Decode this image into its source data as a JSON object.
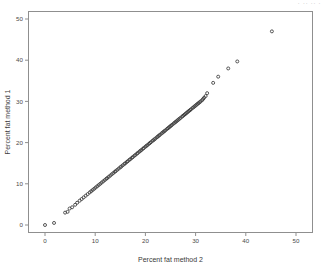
{
  "window": {
    "title_sliver": "·  ··    ··    ·"
  },
  "chart_data": {
    "type": "scatter",
    "title": "",
    "xlabel": "Percent fat method 2",
    "ylabel": "Percent fat method 1",
    "xlim": [
      -3,
      53
    ],
    "ylim": [
      -3,
      53
    ],
    "xticks": [
      0,
      10,
      20,
      30,
      40,
      50
    ],
    "yticks": [
      0,
      10,
      20,
      30,
      40,
      50
    ],
    "xticklabels": [
      "0",
      "10",
      "20",
      "30",
      "40",
      "50"
    ],
    "yticklabels": [
      "0",
      "10",
      "20",
      "30",
      "40",
      "50"
    ],
    "grid": false,
    "legend": null,
    "marker": "open-circle",
    "marker_color": "#3a3a3a",
    "marker_size": 3.0,
    "frame": "box",
    "series": [
      {
        "name": "Percent fat method 1 vs method 2",
        "x": [
          0.0,
          1.8,
          4.0,
          4.5,
          4.9,
          5.4,
          6.0,
          6.4,
          6.9,
          7.3,
          7.7,
          8.1,
          8.5,
          8.9,
          9.2,
          9.5,
          9.8,
          10.1,
          10.4,
          10.7,
          11.0,
          11.3,
          11.6,
          11.9,
          12.2,
          12.4,
          12.7,
          13.0,
          13.3,
          13.6,
          13.9,
          14.1,
          14.4,
          14.7,
          15.0,
          15.2,
          15.5,
          15.8,
          16.0,
          16.3,
          16.5,
          16.8,
          17.0,
          17.3,
          17.5,
          17.8,
          18.0,
          18.3,
          18.5,
          18.8,
          19.0,
          19.2,
          19.5,
          19.7,
          20.0,
          20.2,
          20.4,
          20.7,
          20.9,
          21.1,
          21.4,
          21.6,
          21.8,
          22.0,
          22.3,
          22.5,
          22.7,
          22.9,
          23.2,
          23.4,
          23.6,
          23.8,
          24.0,
          24.3,
          24.5,
          24.7,
          24.9,
          25.1,
          25.3,
          25.6,
          25.8,
          26.0,
          26.2,
          26.4,
          26.6,
          26.8,
          27.0,
          27.3,
          27.5,
          27.7,
          27.9,
          28.1,
          28.3,
          28.5,
          28.7,
          28.9,
          29.1,
          29.4,
          29.6,
          29.8,
          30.0,
          30.2,
          30.4,
          30.6,
          30.8,
          31.0,
          31.3,
          31.5,
          31.7,
          32.0,
          32.3,
          33.5,
          34.5,
          36.5,
          38.3,
          45.2
        ],
        "y": [
          0.0,
          0.5,
          3.0,
          3.2,
          4.0,
          4.3,
          4.9,
          5.4,
          5.9,
          6.3,
          6.7,
          7.1,
          7.5,
          7.9,
          8.2,
          8.5,
          8.8,
          9.1,
          9.4,
          9.7,
          10.0,
          10.3,
          10.6,
          10.9,
          11.2,
          11.4,
          11.7,
          12.0,
          12.3,
          12.6,
          12.9,
          13.1,
          13.4,
          13.7,
          14.0,
          14.2,
          14.5,
          14.8,
          15.0,
          15.3,
          15.5,
          15.8,
          16.0,
          16.3,
          16.5,
          16.8,
          17.0,
          17.3,
          17.5,
          17.8,
          18.0,
          18.2,
          18.5,
          18.7,
          19.0,
          19.2,
          19.4,
          19.7,
          19.9,
          20.1,
          20.4,
          20.6,
          20.8,
          21.0,
          21.3,
          21.5,
          21.7,
          21.9,
          22.2,
          22.4,
          22.6,
          22.8,
          23.0,
          23.3,
          23.5,
          23.7,
          23.9,
          24.1,
          24.3,
          24.6,
          24.8,
          25.0,
          25.2,
          25.4,
          25.6,
          25.8,
          26.0,
          26.3,
          26.5,
          26.7,
          26.9,
          27.1,
          27.3,
          27.5,
          27.7,
          27.9,
          28.1,
          28.4,
          28.6,
          28.8,
          29.0,
          29.2,
          29.4,
          29.6,
          29.8,
          30.0,
          30.3,
          30.6,
          30.9,
          31.3,
          32.0,
          34.5,
          36.0,
          38.0,
          39.7,
          47.0
        ]
      }
    ]
  }
}
